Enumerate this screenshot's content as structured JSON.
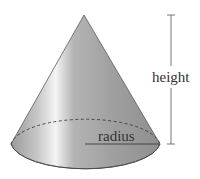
{
  "diagram": {
    "shape": "cone",
    "labels": {
      "height": "height",
      "radius": "radius"
    },
    "colors": {
      "cone_fill_dark": "#8c8c8c",
      "cone_fill_mid": "#a8a8a8",
      "cone_highlight": "#f2f2f2",
      "outline": "#4a4a4a",
      "measure_line": "#555555",
      "text": "#333333"
    }
  }
}
